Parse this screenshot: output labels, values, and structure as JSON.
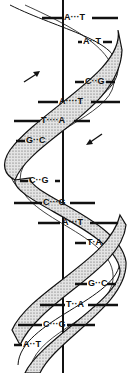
{
  "diagram": {
    "colors": {
      "ink": "#111111",
      "ribbon_fill": "#d8d8d8",
      "background": "#ffffff"
    },
    "arrows": [
      {
        "direction": "up-right",
        "position": "left-upper"
      },
      {
        "direction": "down-left",
        "position": "right-middle"
      }
    ],
    "base_pairs": [
      {
        "left": "A",
        "right": "T",
        "x": 70,
        "y": 14
      },
      {
        "left": "A",
        "right": "T",
        "x": 80,
        "y": 38
      },
      {
        "left": "C",
        "right": "G",
        "x": 85,
        "y": 78
      },
      {
        "left": "A",
        "right": "T",
        "x": 60,
        "y": 98
      },
      {
        "left": "T",
        "right": "A",
        "x": 42,
        "y": 117
      },
      {
        "left": "G",
        "right": "C",
        "x": 27,
        "y": 138
      },
      {
        "left": "C",
        "right": "G",
        "x": 30,
        "y": 178
      },
      {
        "left": "C",
        "right": "G",
        "x": 44,
        "y": 200
      },
      {
        "left": "A",
        "right": "T",
        "x": 63,
        "y": 220
      },
      {
        "left": "T",
        "right": "A",
        "x": 88,
        "y": 240
      },
      {
        "left": "G",
        "right": "C",
        "x": 89,
        "y": 281
      },
      {
        "left": "T",
        "right": "A",
        "x": 67,
        "y": 302
      },
      {
        "left": "C",
        "right": "G",
        "x": 44,
        "y": 322
      },
      {
        "left": "A",
        "right": "T",
        "x": 24,
        "y": 342
      }
    ]
  }
}
